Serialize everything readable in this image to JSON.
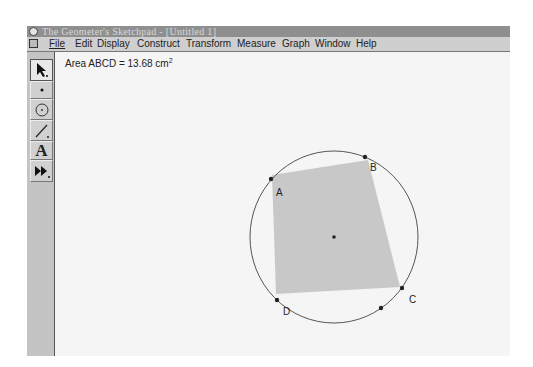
{
  "window": {
    "title": "The Geometer's Sketchpad - [Untitled 1]"
  },
  "menubar": {
    "items": [
      {
        "label": "File",
        "x": 22
      },
      {
        "label": "Edit",
        "x": 48
      },
      {
        "label": "Display",
        "x": 70
      },
      {
        "label": "Construct",
        "x": 110
      },
      {
        "label": "Transform",
        "x": 159
      },
      {
        "label": "Measure",
        "x": 210
      },
      {
        "label": "Graph",
        "x": 255
      },
      {
        "label": "Window",
        "x": 288
      },
      {
        "label": "Help",
        "x": 329
      }
    ]
  },
  "toolbar": {
    "tools": [
      {
        "name": "selection-arrow-tool",
        "glyph": "arrow-icon",
        "active": true
      },
      {
        "name": "point-tool",
        "glyph": "point-icon"
      },
      {
        "name": "compass-tool",
        "glyph": "circle-icon"
      },
      {
        "name": "straightedge-tool",
        "glyph": "line-icon"
      },
      {
        "name": "text-tool",
        "glyph": "A"
      },
      {
        "name": "custom-tool",
        "glyph": "fast-forward-icon"
      }
    ]
  },
  "canvas": {
    "measurement": {
      "label": "Area ABCD = 13.68 cm",
      "unit_exponent": "2"
    },
    "circle": {
      "cx": 334,
      "cy": 237,
      "rx": 84,
      "ry": 86
    },
    "center_point": {
      "x": 334,
      "y": 237
    },
    "polygon": {
      "points": "272,175 368,160 400,287 276,294",
      "fill": "#c8c8c8"
    },
    "points": [
      {
        "label": "A",
        "x": 271,
        "y": 179,
        "lx": 276,
        "ly": 196
      },
      {
        "label": "B",
        "x": 365,
        "y": 157,
        "lx": 370,
        "ly": 171
      },
      {
        "label": "C",
        "x": 402,
        "y": 288,
        "lx": 409,
        "ly": 303
      },
      {
        "label": "D",
        "x": 277,
        "y": 300,
        "lx": 283,
        "ly": 315
      },
      {
        "label": "",
        "x": 381,
        "y": 308
      }
    ]
  }
}
